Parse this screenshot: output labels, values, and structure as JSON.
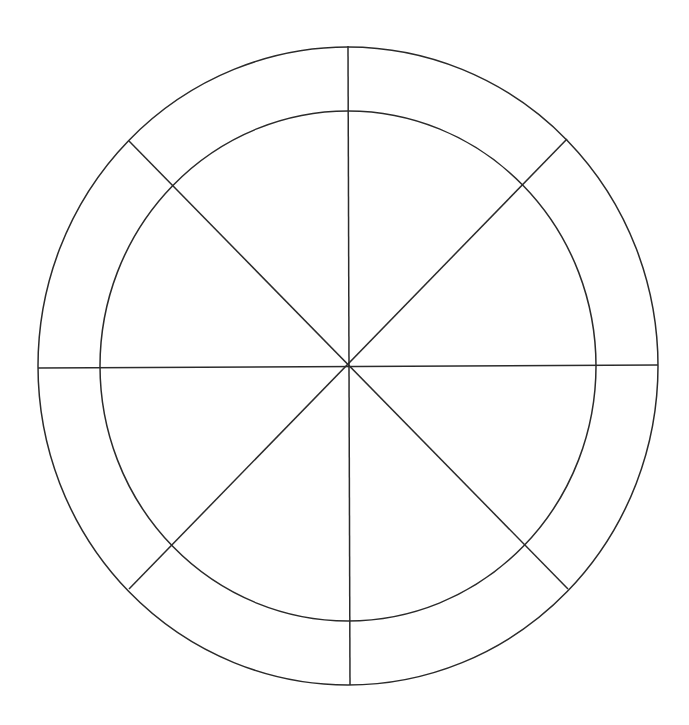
{
  "diagram": {
    "type": "segmented-wheel",
    "background": "#ffffff",
    "stroke_color": "#2b2b2b",
    "stroke_width": 1.5,
    "center": {
      "x": 348,
      "y": 366
    },
    "outer_ellipse": {
      "rx": 310,
      "ry": 319
    },
    "inner_ellipse": {
      "rx": 248,
      "ry": 255
    },
    "segments": 8,
    "spokes": [
      {
        "name": "spoke-vertical",
        "x1": 348,
        "y1": 46,
        "x2": 350,
        "y2": 685
      },
      {
        "name": "spoke-horizontal",
        "x1": 38,
        "y1": 368,
        "x2": 658,
        "y2": 365
      },
      {
        "name": "spoke-diagonal-nw-se",
        "x1": 129,
        "y1": 141,
        "x2": 568,
        "y2": 589
      },
      {
        "name": "spoke-diagonal-ne-sw",
        "x1": 567,
        "y1": 139,
        "x2": 129,
        "y2": 589
      }
    ],
    "labels": []
  }
}
